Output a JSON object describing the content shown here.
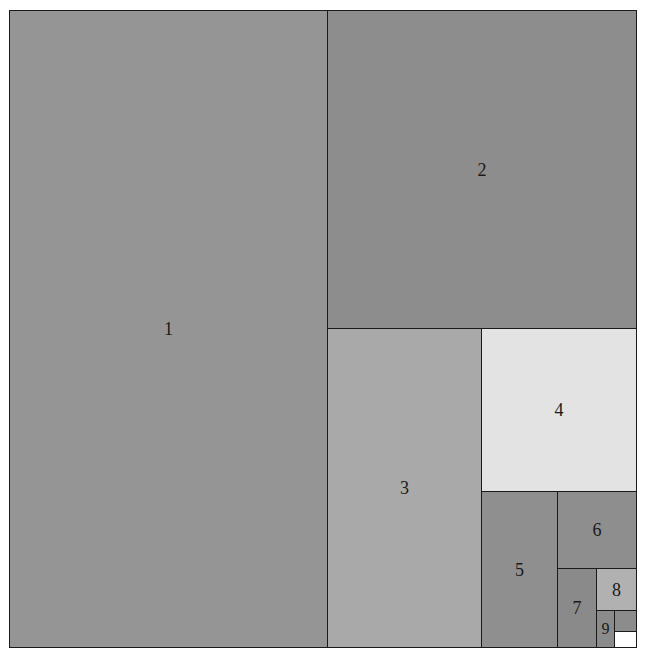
{
  "diagram": {
    "type": "rectangle-subdivision",
    "bounds": {
      "x": 9,
      "y": 10,
      "width": 628,
      "height": 638
    },
    "cells": [
      {
        "label": "1",
        "x": 9,
        "y": 10,
        "w": 319,
        "h": 638,
        "color": "#959595"
      },
      {
        "label": "2",
        "x": 327,
        "y": 10,
        "w": 310,
        "h": 319,
        "color": "#8d8d8d"
      },
      {
        "label": "3",
        "x": 327,
        "y": 328,
        "w": 155,
        "h": 320,
        "color": "#a9a9a9"
      },
      {
        "label": "4",
        "x": 481,
        "y": 328,
        "w": 156,
        "h": 164,
        "color": "#e3e3e3"
      },
      {
        "label": "5",
        "x": 481,
        "y": 491,
        "w": 77,
        "h": 157,
        "color": "#8f8f8f"
      },
      {
        "label": "6",
        "x": 557,
        "y": 491,
        "w": 80,
        "h": 78,
        "color": "#8e8e8e"
      },
      {
        "label": "7",
        "x": 557,
        "y": 568,
        "w": 40,
        "h": 80,
        "color": "#8a8a8a"
      },
      {
        "label": "8",
        "x": 596,
        "y": 568,
        "w": 41,
        "h": 43,
        "color": "#b1b1b1"
      },
      {
        "label": "9",
        "x": 596,
        "y": 610,
        "w": 19,
        "h": 38,
        "color": "#8b8b8b"
      },
      {
        "label": "",
        "x": 614,
        "y": 610,
        "w": 23,
        "h": 22,
        "color": "#8c8c8c"
      },
      {
        "label": "",
        "x": 614,
        "y": 631,
        "w": 23,
        "h": 17,
        "color": "#ffffff"
      }
    ]
  }
}
